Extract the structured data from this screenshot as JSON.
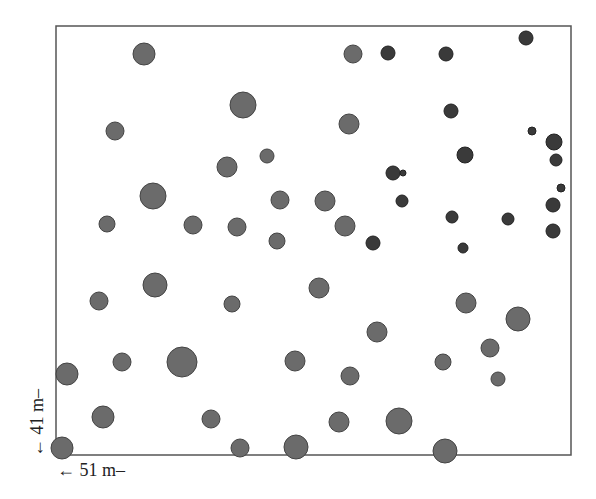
{
  "diagram": {
    "type": "tree-stem-map",
    "plot_frame": {
      "x": 56,
      "y": 26,
      "width": 515,
      "height": 429
    },
    "x_dimension_label": "← 51 m–",
    "y_dimension_label": "← 41 m–",
    "colors": {
      "frame": "#555555",
      "medium_fill": "#6b6b6b",
      "medium_stroke": "#444444",
      "dark_fill": "#3a3a3a",
      "dark_stroke": "#222222"
    },
    "circles": [
      {
        "x": 144,
        "y": 54,
        "r": 11,
        "shade": "medium"
      },
      {
        "x": 353,
        "y": 54,
        "r": 9,
        "shade": "medium"
      },
      {
        "x": 388,
        "y": 53,
        "r": 7,
        "shade": "dark"
      },
      {
        "x": 446,
        "y": 54,
        "r": 7,
        "shade": "dark"
      },
      {
        "x": 526,
        "y": 38,
        "r": 7,
        "shade": "dark"
      },
      {
        "x": 243,
        "y": 105,
        "r": 13,
        "shade": "medium"
      },
      {
        "x": 451,
        "y": 111,
        "r": 7,
        "shade": "dark"
      },
      {
        "x": 115,
        "y": 131,
        "r": 9,
        "shade": "medium"
      },
      {
        "x": 349,
        "y": 124,
        "r": 10,
        "shade": "medium"
      },
      {
        "x": 532,
        "y": 131,
        "r": 4,
        "shade": "dark"
      },
      {
        "x": 554,
        "y": 142,
        "r": 8,
        "shade": "dark"
      },
      {
        "x": 267,
        "y": 156,
        "r": 7,
        "shade": "medium"
      },
      {
        "x": 465,
        "y": 155,
        "r": 8,
        "shade": "dark"
      },
      {
        "x": 556,
        "y": 160,
        "r": 6,
        "shade": "dark"
      },
      {
        "x": 227,
        "y": 167,
        "r": 10,
        "shade": "medium"
      },
      {
        "x": 393,
        "y": 173,
        "r": 7,
        "shade": "dark"
      },
      {
        "x": 403,
        "y": 173,
        "r": 3,
        "shade": "dark"
      },
      {
        "x": 561,
        "y": 188,
        "r": 4,
        "shade": "dark"
      },
      {
        "x": 153,
        "y": 196,
        "r": 13,
        "shade": "medium"
      },
      {
        "x": 280,
        "y": 200,
        "r": 9,
        "shade": "medium"
      },
      {
        "x": 325,
        "y": 201,
        "r": 10,
        "shade": "medium"
      },
      {
        "x": 402,
        "y": 201,
        "r": 6,
        "shade": "dark"
      },
      {
        "x": 553,
        "y": 205,
        "r": 7,
        "shade": "dark"
      },
      {
        "x": 452,
        "y": 217,
        "r": 6,
        "shade": "dark"
      },
      {
        "x": 508,
        "y": 219,
        "r": 6,
        "shade": "dark"
      },
      {
        "x": 107,
        "y": 224,
        "r": 8,
        "shade": "medium"
      },
      {
        "x": 193,
        "y": 225,
        "r": 9,
        "shade": "medium"
      },
      {
        "x": 237,
        "y": 227,
        "r": 9,
        "shade": "medium"
      },
      {
        "x": 345,
        "y": 226,
        "r": 10,
        "shade": "medium"
      },
      {
        "x": 553,
        "y": 231,
        "r": 7,
        "shade": "dark"
      },
      {
        "x": 277,
        "y": 241,
        "r": 8,
        "shade": "medium"
      },
      {
        "x": 373,
        "y": 243,
        "r": 7,
        "shade": "dark"
      },
      {
        "x": 463,
        "y": 248,
        "r": 5,
        "shade": "dark"
      },
      {
        "x": 155,
        "y": 285,
        "r": 12,
        "shade": "medium"
      },
      {
        "x": 319,
        "y": 288,
        "r": 10,
        "shade": "medium"
      },
      {
        "x": 99,
        "y": 301,
        "r": 9,
        "shade": "medium"
      },
      {
        "x": 232,
        "y": 304,
        "r": 8,
        "shade": "medium"
      },
      {
        "x": 466,
        "y": 303,
        "r": 10,
        "shade": "medium"
      },
      {
        "x": 518,
        "y": 319,
        "r": 12,
        "shade": "medium"
      },
      {
        "x": 377,
        "y": 332,
        "r": 10,
        "shade": "medium"
      },
      {
        "x": 490,
        "y": 348,
        "r": 9,
        "shade": "medium"
      },
      {
        "x": 122,
        "y": 362,
        "r": 9,
        "shade": "medium"
      },
      {
        "x": 182,
        "y": 362,
        "r": 15,
        "shade": "medium"
      },
      {
        "x": 295,
        "y": 361,
        "r": 10,
        "shade": "medium"
      },
      {
        "x": 443,
        "y": 362,
        "r": 8,
        "shade": "medium"
      },
      {
        "x": 67,
        "y": 374,
        "r": 11,
        "shade": "medium"
      },
      {
        "x": 350,
        "y": 376,
        "r": 9,
        "shade": "medium"
      },
      {
        "x": 498,
        "y": 379,
        "r": 7,
        "shade": "medium"
      },
      {
        "x": 103,
        "y": 417,
        "r": 11,
        "shade": "medium"
      },
      {
        "x": 211,
        "y": 419,
        "r": 9,
        "shade": "medium"
      },
      {
        "x": 339,
        "y": 422,
        "r": 10,
        "shade": "medium"
      },
      {
        "x": 399,
        "y": 421,
        "r": 13,
        "shade": "medium"
      },
      {
        "x": 62,
        "y": 448,
        "r": 11,
        "shade": "medium"
      },
      {
        "x": 240,
        "y": 448,
        "r": 9,
        "shade": "medium"
      },
      {
        "x": 296,
        "y": 447,
        "r": 12,
        "shade": "medium"
      },
      {
        "x": 445,
        "y": 451,
        "r": 12,
        "shade": "medium"
      }
    ]
  }
}
